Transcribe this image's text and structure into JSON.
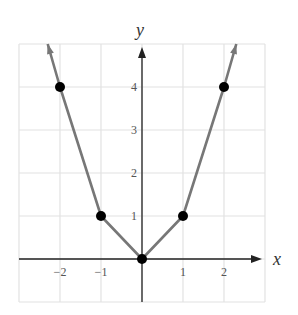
{
  "chart_data": {
    "type": "line",
    "title": "",
    "xlabel": "x",
    "ylabel": "y",
    "xlim": [
      -3,
      3
    ],
    "ylim": [
      -1,
      5
    ],
    "grid": true,
    "x_ticks": [
      "-2",
      "-1",
      "1",
      "2"
    ],
    "y_ticks": [
      "1",
      "2",
      "3",
      "4"
    ],
    "series": [
      {
        "name": "graph",
        "points": [
          [
            -2.3,
            5
          ],
          [
            -2,
            4
          ],
          [
            -1,
            1
          ],
          [
            0,
            0
          ],
          [
            1,
            1
          ],
          [
            2,
            4
          ],
          [
            2.3,
            5
          ]
        ],
        "marked_points": [
          [
            -2,
            4
          ],
          [
            -1,
            1
          ],
          [
            0,
            0
          ],
          [
            1,
            1
          ],
          [
            2,
            4
          ]
        ],
        "arrows_at_ends": true
      }
    ],
    "colors": {
      "line": "#777777",
      "points": "#000000",
      "grid": "#e2e2e2",
      "axes": "#222222"
    }
  }
}
